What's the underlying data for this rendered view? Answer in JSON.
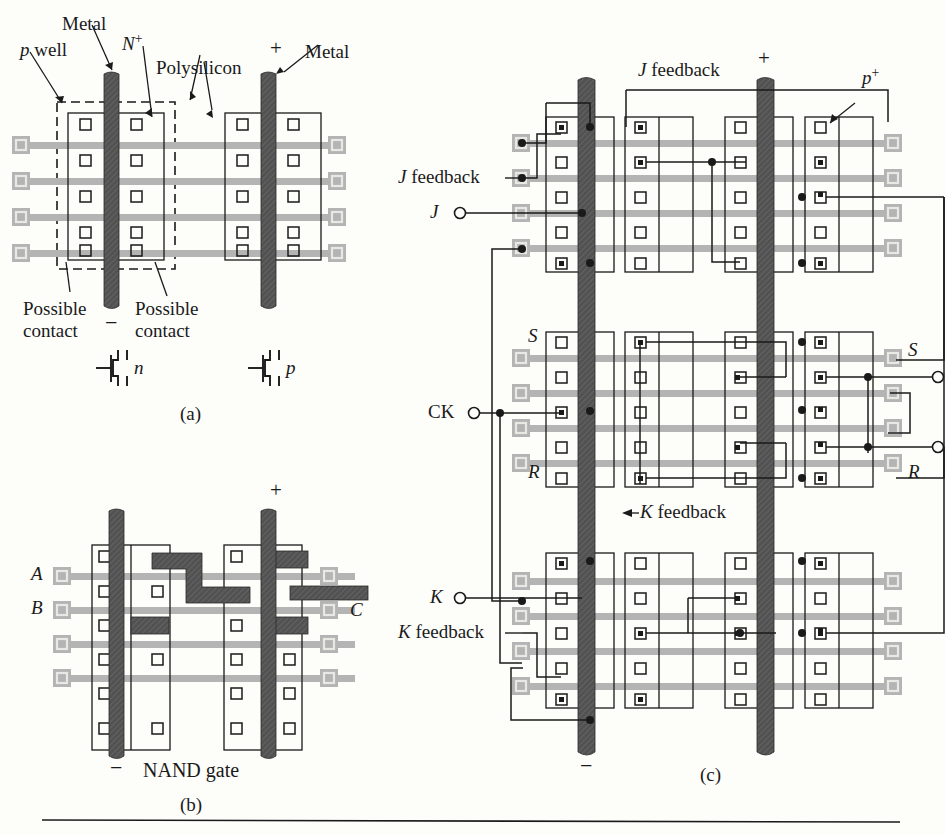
{
  "figure": {
    "type": "cmos-gate-array-layout",
    "panels": [
      {
        "id": "a",
        "caption": "(a)",
        "description": "Basic CMOS gate-array cell with p well, N+ diffusion, polysilicon gates, metal power rails"
      },
      {
        "id": "b",
        "caption": "(b)",
        "description": "NAND gate personalization of the cell"
      },
      {
        "id": "c",
        "caption": "(c)",
        "description": "JK flip-flop built from four cells"
      }
    ]
  },
  "panel_a": {
    "caption": "(a)",
    "labels": {
      "p_well": "p well",
      "metal_left": "Metal",
      "n_plus": "N",
      "n_plus_sup": "+",
      "polysilicon": "Polysilicon",
      "plus_rail": "+",
      "metal_right": "Metal",
      "minus_rail": "−",
      "possible_contact_left_1": "Possible",
      "possible_contact_left_2": "contact",
      "possible_contact_right_1": "Possible",
      "possible_contact_right_2": "contact"
    },
    "transistors": [
      {
        "type": "n",
        "label": "n"
      },
      {
        "type": "p",
        "label": "p"
      }
    ]
  },
  "panel_b": {
    "caption": "(b)",
    "title": "NAND gate",
    "minus_rail": "−",
    "plus_rail": "+",
    "inputs": [
      {
        "name": "A",
        "label": "A"
      },
      {
        "name": "B",
        "label": "B"
      }
    ],
    "outputs": [
      {
        "name": "C",
        "label": "C"
      }
    ]
  },
  "panel_c": {
    "caption": "(c)",
    "labels": {
      "j_feedback_top": "J feedback",
      "j_feedback_left": "J feedback",
      "plus_rail": "+",
      "p_plus": "p",
      "p_plus_sup": "+",
      "minus_rail": "−",
      "k_feedback_mid": "K feedback",
      "k_feedback_left": "K feedback"
    },
    "pins": [
      {
        "name": "J",
        "label": "J",
        "side": "left"
      },
      {
        "name": "CK",
        "label": "CK",
        "side": "left"
      },
      {
        "name": "K",
        "label": "K",
        "side": "left"
      },
      {
        "name": "Q",
        "label": "Q",
        "side": "right"
      },
      {
        "name": "Qbar",
        "label": "Q",
        "overbar": true,
        "side": "right"
      }
    ],
    "internal_nodes": [
      {
        "name": "S-left",
        "label": "S"
      },
      {
        "name": "S-right",
        "label": "S"
      },
      {
        "name": "R-left",
        "label": "R"
      },
      {
        "name": "R-right",
        "label": "R"
      }
    ]
  },
  "colors": {
    "metal_rail": "#4a4a4a",
    "polysilicon": "#a8a8a8",
    "diffusion_outline": "#1a1a1a",
    "contact_outline": "#1a1a1a",
    "wire": "#1a1a1a",
    "background": "#fdfdfa"
  }
}
